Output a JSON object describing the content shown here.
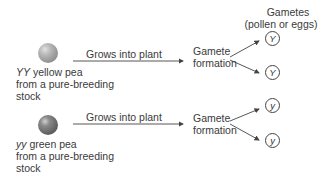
{
  "header": {
    "gametes_title": "Gametes",
    "gametes_subtitle": "(pollen or eggs)"
  },
  "rows": [
    {
      "genotype": "YY",
      "pea_label": "yellow pea",
      "source_line1": "from a pure-breeding",
      "source_line2": "stock",
      "pea_color": "yellow",
      "arrow_label": "Grows into plant",
      "process_line1": "Gamete",
      "process_line2": "formation",
      "gametes": [
        "Y",
        "Y"
      ]
    },
    {
      "genotype": "yy",
      "pea_label": "green pea",
      "source_line1": "from a pure-breeding",
      "source_line2": "stock",
      "pea_color": "green",
      "arrow_label": "Grows into plant",
      "process_line1": "Gamete",
      "process_line2": "formation",
      "gametes": [
        "y",
        "y"
      ]
    }
  ],
  "colors": {
    "text": "#3a3a3a",
    "lines": "#444444",
    "background": "#ffffff"
  }
}
